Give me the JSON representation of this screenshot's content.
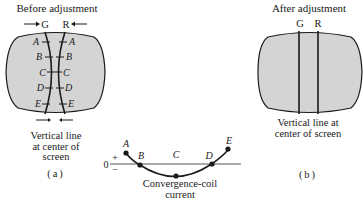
{
  "panel_a": {
    "title": "Before adjustment",
    "label_g": "G",
    "label_r": "R",
    "points": [
      "A",
      "B",
      "C",
      "D",
      "E"
    ],
    "caption_line1": "Vertical line",
    "caption_line2": "at center of",
    "caption_line3": "screen",
    "tag": "(a)"
  },
  "panel_b": {
    "title": "After adjustment",
    "label_g": "G",
    "label_r": "R",
    "caption_line1": "Vertical line at",
    "caption_line2": "center of screen",
    "tag": "(b)"
  },
  "graph": {
    "zero_label": "0",
    "plus_label": "+",
    "minus_label": "−",
    "points": [
      "A",
      "B",
      "C",
      "D",
      "E"
    ],
    "caption_line1": "Convergence-coil",
    "caption_line2": "current"
  },
  "colors": {
    "screen_fill": "#d4d4d4",
    "outline": "#1a1a1a"
  }
}
